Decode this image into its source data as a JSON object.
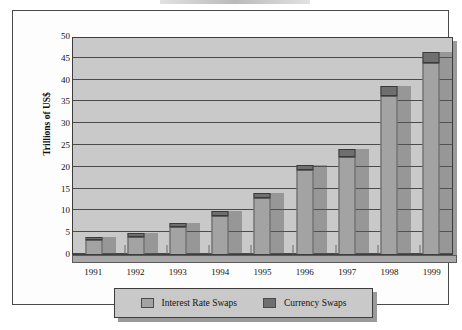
{
  "chart_data": {
    "type": "bar",
    "subtype": "stacked-bar",
    "title": "",
    "xlabel": "",
    "ylabel": "Trillions of US$",
    "categories": [
      "1991",
      "1992",
      "1993",
      "1994",
      "1995",
      "1996",
      "1997",
      "1998",
      "1999"
    ],
    "series": [
      {
        "name": "Interest Rate Swaps",
        "color": "#a3a3a3",
        "values": [
          3.1,
          3.9,
          6.2,
          8.8,
          12.8,
          19.2,
          22.3,
          36.3,
          43.9
        ]
      },
      {
        "name": "Currency Swaps",
        "color": "#6f6f6f",
        "values": [
          0.8,
          0.9,
          0.9,
          1.0,
          1.2,
          1.3,
          1.8,
          2.3,
          2.4
        ]
      }
    ],
    "totals": [
      3.9,
      4.8,
      7.1,
      9.8,
      14.0,
      20.5,
      24.1,
      38.6,
      46.3
    ],
    "ylim": [
      0,
      50
    ],
    "yticks": [
      0,
      5,
      10,
      15,
      20,
      25,
      30,
      35,
      40,
      45,
      50
    ],
    "ytick_labels": [
      "0",
      "5",
      "10",
      "15",
      "20",
      "25",
      "30",
      "35",
      "40",
      "45",
      "50"
    ],
    "grid": true,
    "grid_axis": "y",
    "legend_position": "bottom",
    "plot_background": "#c9c9c9"
  },
  "axis": {
    "y_title": "Trillions of US$"
  },
  "legend": {
    "items": [
      {
        "label": "Interest Rate Swaps",
        "color": "#a3a3a3"
      },
      {
        "label": "Currency Swaps",
        "color": "#6f6f6f"
      }
    ]
  }
}
